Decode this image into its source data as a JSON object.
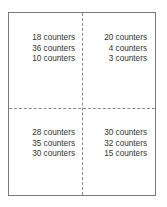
{
  "diagram": {
    "type": "quadrant-grid",
    "colors": {
      "border": "#7a7a7a",
      "divider": "#8a8a8a",
      "text": "#333333"
    },
    "cells": [
      {
        "position": "top-left",
        "lines": [
          "18 counters",
          "36 counters",
          "10 counters"
        ]
      },
      {
        "position": "top-right",
        "lines": [
          "20 counters",
          "4 counters",
          "3 counters"
        ]
      },
      {
        "position": "bottom-left",
        "lines": [
          "28 counters",
          "35 counters",
          "30 counters"
        ]
      },
      {
        "position": "bottom-right",
        "lines": [
          "30 counters",
          "32 counters",
          "15 counters"
        ]
      }
    ]
  }
}
